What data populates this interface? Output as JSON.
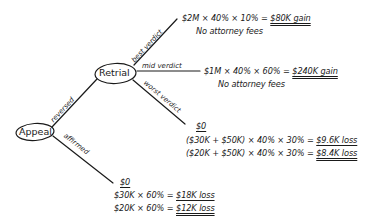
{
  "diagram": {
    "type": "decision-tree",
    "style": "handwritten",
    "ink_color": "#1a1a1a",
    "background": "#ffffff",
    "nodes": {
      "appeal": {
        "label": "Appeal"
      },
      "retrial": {
        "label": "Retrial"
      }
    },
    "branches": {
      "reversed": {
        "label": "reversed"
      },
      "affirmed": {
        "label": "affirmed"
      },
      "best": {
        "label": "best verdict"
      },
      "mid": {
        "label": "mid verdict"
      },
      "worst": {
        "label": "worst verdict"
      }
    },
    "outcomes": {
      "best": {
        "line1_expr": "$2M × 40% × 10% = ",
        "line1_result": "$80K gain",
        "line2": "No attorney fees"
      },
      "mid": {
        "line1_expr": "$1M × 40% × 60% = ",
        "line1_result": "$240K gain",
        "line2": "No attorney fees"
      },
      "worst": {
        "header": "$0",
        "line1_expr": "($30K + $50K) × 40% × 30% = ",
        "line1_result": "$9.6K loss",
        "line2_expr": "($20K + $50K) × 40% × 30% = ",
        "line2_result": "$8.4K loss"
      },
      "affirmed": {
        "header": "$0",
        "line1_expr": "$30K × 60% = ",
        "line1_result": "$18K loss",
        "line2_expr": "$20K × 60% = ",
        "line2_result": "$12K loss"
      }
    }
  }
}
